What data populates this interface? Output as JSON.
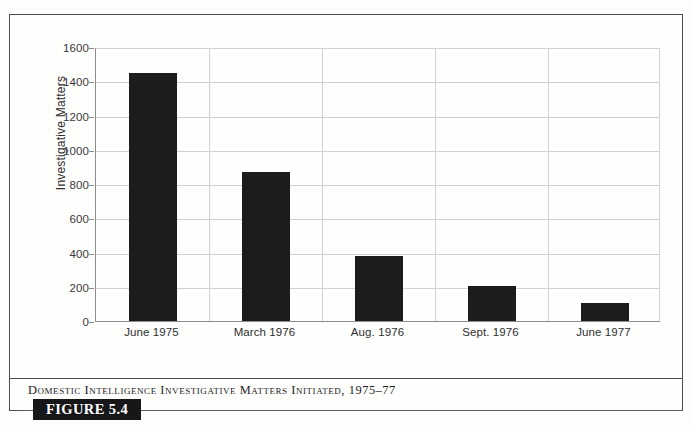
{
  "figure": {
    "tag_label": "FIGURE 5.4",
    "caption": "Domestic Intelligence Investigative Matters Initiated, 1975–77"
  },
  "chart_data": {
    "type": "bar",
    "title": "",
    "subtitle": "",
    "categories": [
      "June 1975",
      "March 1976",
      "Aug. 1976",
      "Sept. 1976",
      "June 1977"
    ],
    "values": [
      1450,
      870,
      380,
      205,
      105
    ],
    "series": [
      {
        "name": "Investigative Matters",
        "values": [
          1450,
          870,
          380,
          205,
          105
        ]
      }
    ],
    "xlabel": "",
    "ylabel": "Investigative Matters",
    "ylim": [
      0,
      1600
    ],
    "ytick_labels": [
      "1600",
      "1400",
      "1200",
      "1000",
      "800",
      "600",
      "400",
      "200",
      "0"
    ],
    "ytick_values": [
      1600,
      1400,
      1200,
      1000,
      800,
      600,
      400,
      200,
      0
    ],
    "ytick_interval": 200,
    "grid": "horizontal-and-vertical",
    "legend": "none",
    "bar_color": "#1c1c1c",
    "grid_color": "#d2d2d2",
    "axis_color": "#8d8d8d"
  }
}
